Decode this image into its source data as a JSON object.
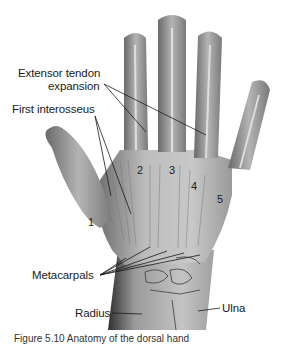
{
  "figure": {
    "colors": {
      "background": "#ffffff",
      "skin_light": "#d9d9d9",
      "skin_mid": "#a8a8a8",
      "skin_dark": "#5a5a5a",
      "leader_line": "#1a1a1a"
    },
    "labels": {
      "extensor_line1": "Extensor tendon",
      "extensor_line2": "expansion",
      "first_interosseus": "First interosseus",
      "metacarpals": "Metacarpals",
      "radius": "Radius",
      "ulna": "Ulna"
    },
    "metacarpal_numbers": [
      "1",
      "2",
      "3",
      "4",
      "5"
    ],
    "caption": "Figure 5.10  Anatomy of the dorsal hand"
  }
}
